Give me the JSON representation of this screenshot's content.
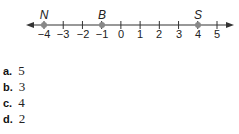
{
  "number_line": {
    "min": -4,
    "max": 5,
    "ticks": [
      "−4",
      "−3",
      "−2",
      "−1",
      "0",
      "1",
      "2",
      "3",
      "4",
      "5"
    ],
    "points": [
      {
        "label": "N",
        "value": -4
      },
      {
        "label": "B",
        "value": -1
      },
      {
        "label": "S",
        "value": 4
      }
    ],
    "colors": {
      "line": "#333333",
      "point": "#888888"
    }
  },
  "options": [
    {
      "letter": "a.",
      "value": "5"
    },
    {
      "letter": "b.",
      "value": "3"
    },
    {
      "letter": "c.",
      "value": "4"
    },
    {
      "letter": "d.",
      "value": "2"
    }
  ]
}
